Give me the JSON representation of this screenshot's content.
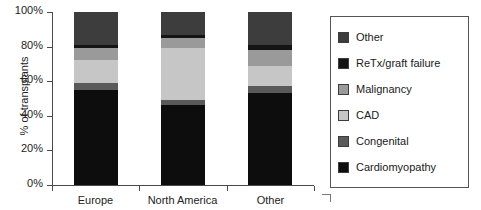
{
  "chart_data": {
    "type": "bar",
    "subtype": "stacked-percentage-column",
    "title": "",
    "xlabel": "",
    "ylabel": "% of transplants",
    "ylim": [
      0,
      100
    ],
    "ytick_labels": [
      "0%",
      "20%",
      "40%",
      "60%",
      "80%",
      "100%"
    ],
    "ytick_values": [
      0,
      20,
      40,
      60,
      80,
      100
    ],
    "grid": false,
    "legend_position": "right",
    "categories": [
      "Europe",
      "North America",
      "Other"
    ],
    "series": [
      {
        "name": "Cardiomyopathy",
        "color": "#0d0d0d",
        "values": [
          55,
          46,
          53
        ]
      },
      {
        "name": "Congenital",
        "color": "#5a5a5a",
        "values": [
          4,
          3,
          4
        ]
      },
      {
        "name": "CAD",
        "color": "#c6c6c6",
        "values": [
          13,
          30,
          12
        ]
      },
      {
        "name": "Malignancy",
        "color": "#9a9a9a",
        "values": [
          7,
          6,
          9
        ]
      },
      {
        "name": "ReTx/graft failure",
        "color": "#141414",
        "values": [
          2,
          2,
          3
        ]
      },
      {
        "name": "Other",
        "color": "#3d3d3d",
        "values": [
          19,
          13,
          19
        ]
      }
    ]
  },
  "axis": {
    "y_title": "% of transplants"
  },
  "legend": {
    "entries": [
      {
        "label": "Other",
        "color": "#3d3d3d"
      },
      {
        "label": "ReTx/graft failure",
        "color": "#141414"
      },
      {
        "label": "Malignancy",
        "color": "#9a9a9a"
      },
      {
        "label": "CAD",
        "color": "#c6c6c6"
      },
      {
        "label": "Congenital",
        "color": "#5a5a5a"
      },
      {
        "label": "Cardiomyopathy",
        "color": "#0d0d0d"
      }
    ]
  }
}
